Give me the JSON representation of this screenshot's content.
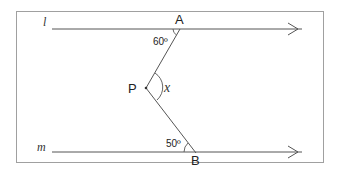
{
  "diagram": {
    "type": "geometry-parallel-lines-angle",
    "lines": {
      "l": {
        "label": "l"
      },
      "m": {
        "label": "m"
      }
    },
    "points": {
      "A": {
        "label": "A"
      },
      "B": {
        "label": "B"
      },
      "P": {
        "label": "P"
      }
    },
    "angles": {
      "at_A": {
        "label": "60º"
      },
      "at_B": {
        "label": "50º"
      },
      "at_P": {
        "label": "x"
      }
    },
    "colors": {
      "frame": "#9a9a9a",
      "line": "#555555",
      "text": "#222222"
    }
  }
}
